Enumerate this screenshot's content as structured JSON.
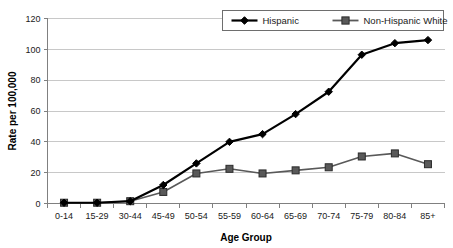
{
  "chart_data": {
    "type": "line",
    "title": "",
    "xlabel": "Age Group",
    "ylabel": "Rate per 100,000",
    "categories": [
      "0-14",
      "15-29",
      "30-44",
      "45-49",
      "50-54",
      "55-59",
      "60-64",
      "65-69",
      "70-74",
      "75-79",
      "80-84",
      "85+"
    ],
    "series": [
      {
        "name": "Hispanic",
        "marker": "diamond",
        "color": "#000000",
        "values": [
          0.5,
          0.5,
          1.5,
          12,
          26,
          40,
          45,
          58,
          72.5,
          96.5,
          104,
          106
        ]
      },
      {
        "name": "Non-Hispanic White",
        "marker": "square",
        "color": "#595959",
        "values": [
          0.5,
          0.5,
          1.5,
          7.5,
          19.5,
          22.5,
          19.5,
          21.5,
          23.5,
          30.5,
          32.5,
          25.5
        ]
      }
    ],
    "ylim": [
      0,
      120
    ],
    "yticks": [
      0,
      20,
      40,
      60,
      80,
      100,
      120
    ],
    "ytick_labels": [
      "0",
      "20",
      "40",
      "60",
      "80",
      "100",
      "120"
    ],
    "grid": "horizontal",
    "legend_position": "top-right",
    "background": "#ffffff",
    "gridline_color": "#c8c8c8",
    "axis_color": "#808080"
  },
  "legend": {
    "entries": [
      {
        "label": "Hispanic"
      },
      {
        "label": "Non-Hispanic White"
      }
    ]
  }
}
